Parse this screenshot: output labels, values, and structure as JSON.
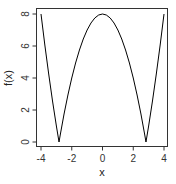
{
  "chart_data": {
    "type": "line",
    "title": "",
    "xlabel": "x",
    "ylabel": "f(x)",
    "xlim": [
      -4,
      4
    ],
    "ylim": [
      0,
      8
    ],
    "x_ticks": [
      -4,
      -2,
      0,
      2,
      4
    ],
    "y_ticks": [
      0,
      2,
      4,
      6,
      8
    ],
    "x_tick_labels": [
      "-4",
      "-2",
      "0",
      "2",
      "4"
    ],
    "y_tick_labels": [
      "0",
      "2",
      "4",
      "6",
      "8"
    ],
    "grid": false,
    "legend": null,
    "series": [
      {
        "name": "f(x) = |8 - x^2|",
        "color": "#000000",
        "x": [
          -4,
          -3.75,
          -3.5,
          -3.25,
          -3,
          -2.828,
          -2.75,
          -2.5,
          -2.25,
          -2,
          -1.75,
          -1.5,
          -1.25,
          -1,
          -0.75,
          -0.5,
          -0.25,
          0,
          0.25,
          0.5,
          0.75,
          1,
          1.25,
          1.5,
          1.75,
          2,
          2.25,
          2.5,
          2.75,
          2.828,
          3,
          3.25,
          3.5,
          3.75,
          4
        ],
        "y": [
          8,
          6.0625,
          4.25,
          2.5625,
          1,
          0,
          0.4375,
          1.75,
          2.9375,
          4,
          4.9375,
          5.75,
          6.4375,
          7,
          7.4375,
          7.75,
          7.9375,
          8,
          7.9375,
          7.75,
          7.4375,
          7,
          6.4375,
          5.75,
          4.9375,
          4,
          2.9375,
          1.75,
          0.4375,
          0,
          1,
          2.5625,
          4.25,
          6.0625,
          8
        ]
      }
    ]
  }
}
